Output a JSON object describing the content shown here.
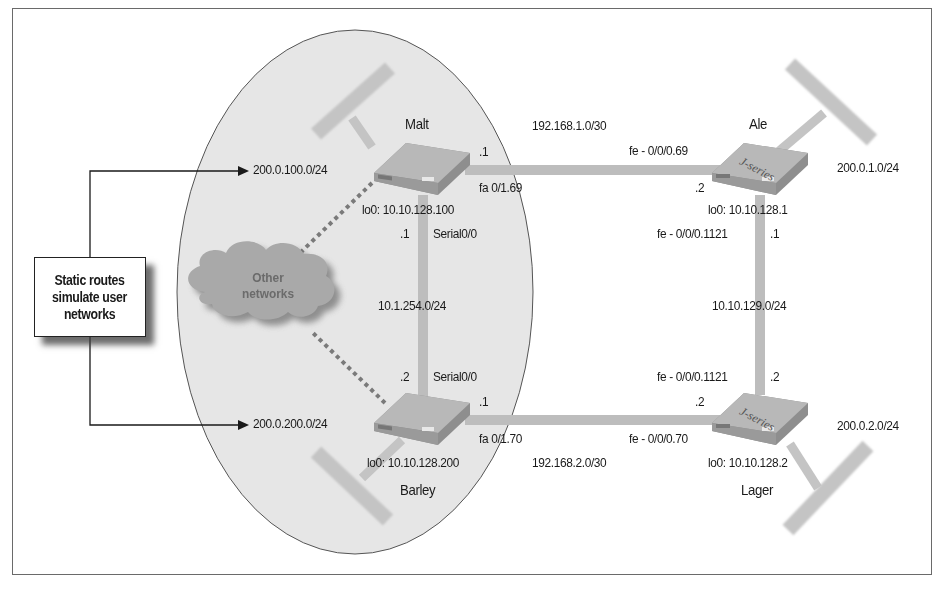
{
  "figure": {
    "type": "network-topology",
    "callout": {
      "line1": "Static routes",
      "line2": "simulate user",
      "line3": "networks"
    },
    "cloud": {
      "line1": "Other",
      "line2": "networks"
    },
    "static_routes": [
      {
        "prefix": "200.0.100.0/24"
      },
      {
        "prefix": "200.0.200.0/24"
      }
    ],
    "routers": {
      "malt": {
        "name": "Malt",
        "loopback": "lo0: 10.10.128.100",
        "if_to_ale": "fa 0/1.69",
        "if_to_ale_host": ".1",
        "if_serial": "Serial0/0",
        "if_serial_host": ".1"
      },
      "barley": {
        "name": "Barley",
        "loopback": "lo0: 10.10.128.200",
        "if_to_lager": "fa 0/1.70",
        "if_to_lager_host": ".1",
        "if_serial": "Serial0/0",
        "if_serial_host": ".2"
      },
      "ale": {
        "name": "Ale",
        "badge": "J-series",
        "loopback": "lo0: 10.10.128.1",
        "if_to_malt": "fe - 0/0/0.69",
        "if_to_malt_host": ".2",
        "if_to_lager": "fe - 0/0/0.1121",
        "if_to_lager_host": ".1",
        "lan": "200.0.1.0/24"
      },
      "lager": {
        "name": "Lager",
        "badge": "J-series",
        "loopback": "lo0: 10.10.128.2",
        "if_to_barley": "fe - 0/0/0.70",
        "if_to_barley_host": ".2",
        "if_to_ale": "fe - 0/0/0.1121",
        "if_to_ale_host": ".2",
        "lan": "200.0.2.0/24"
      }
    },
    "links": {
      "malt_ale": "192.168.1.0/30",
      "barley_lager": "192.168.2.0/30",
      "malt_barley": "10.1.254.0/24",
      "ale_lager": "10.10.129.0/24"
    },
    "colors": {
      "ellipse_fill": "#e6e6e6",
      "link": "#bdbdbd",
      "router_top": "#b4b4b4",
      "router_side": "#8e8e8e",
      "cloud": "#a9a9a9",
      "dotted": "#7a7a7a",
      "frame": "#6a6a6a"
    }
  }
}
